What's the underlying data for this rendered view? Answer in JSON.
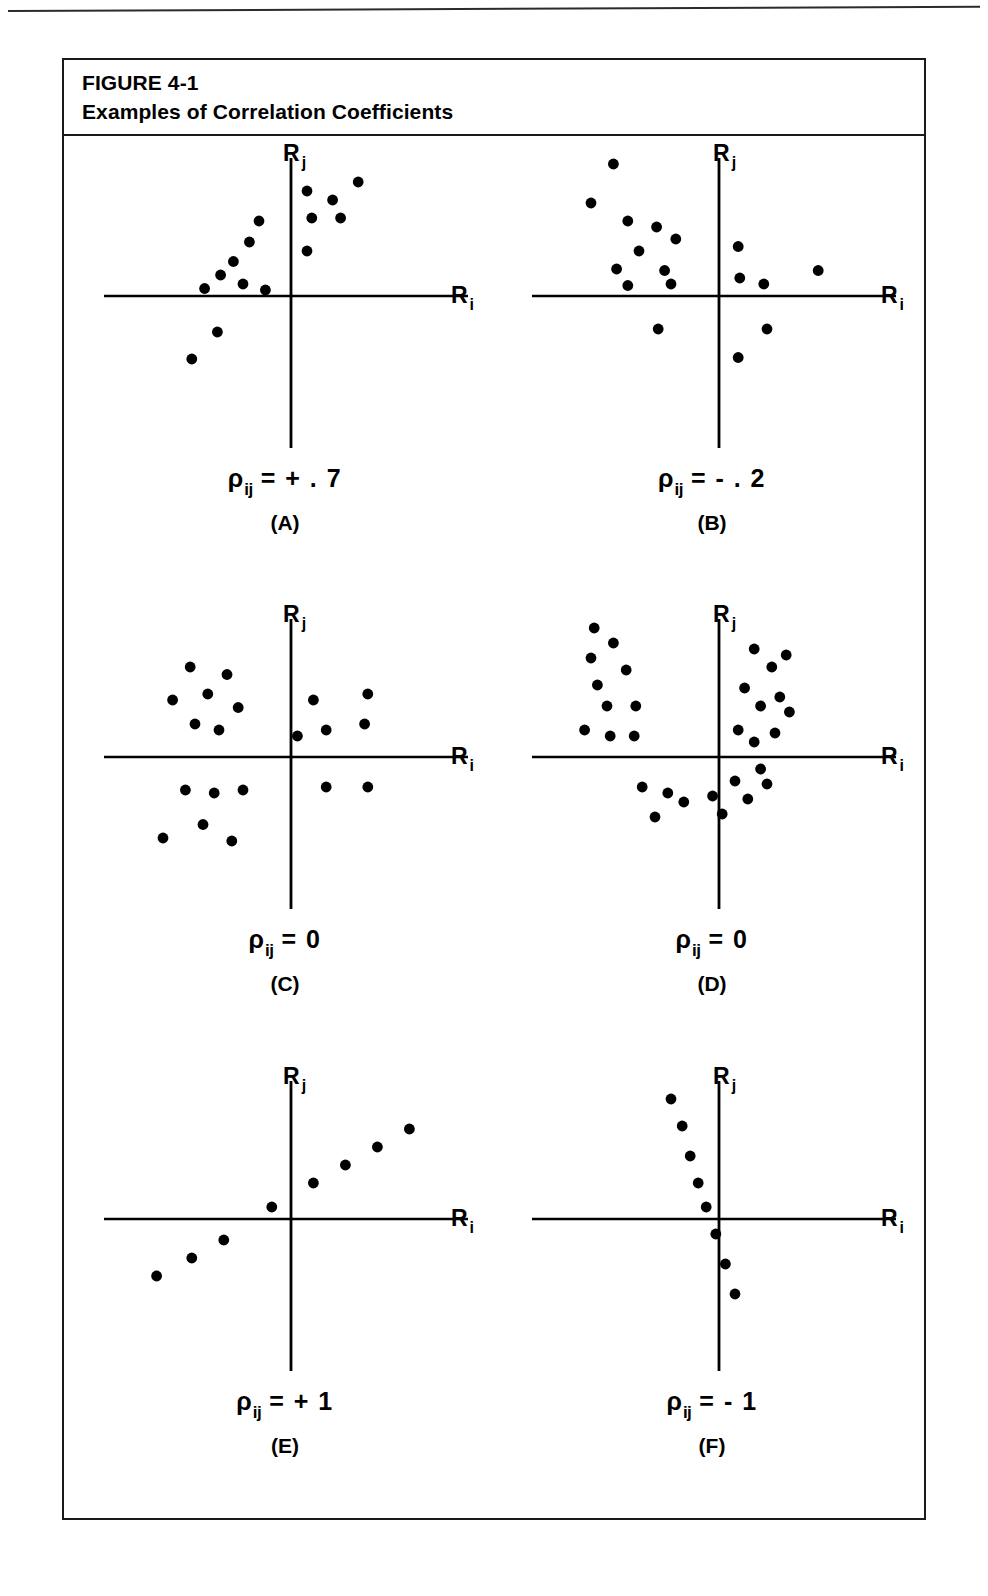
{
  "figure": {
    "number_line": "FIGURE 4-1",
    "title_line": "Examples of Correlation Coefficients"
  },
  "axis": {
    "y_base": "R",
    "y_sub": "j",
    "x_base": "R",
    "x_sub": "i"
  },
  "panels": [
    {
      "letter": "(A)",
      "rho_symbol": "ρ",
      "rho_sub": "ij",
      "rho_value": "= + . 7"
    },
    {
      "letter": "(B)",
      "rho_symbol": "ρ",
      "rho_sub": "ij",
      "rho_value": "= - . 2"
    },
    {
      "letter": "(C)",
      "rho_symbol": "ρ",
      "rho_sub": "ij",
      "rho_value": "= 0"
    },
    {
      "letter": "(D)",
      "rho_symbol": "ρ",
      "rho_sub": "ij",
      "rho_value": "= 0"
    },
    {
      "letter": "(E)",
      "rho_symbol": "ρ",
      "rho_sub": "ij",
      "rho_value": "= + 1"
    },
    {
      "letter": "(F)",
      "rho_symbol": "ρ",
      "rho_sub": "ij",
      "rho_value": "= - 1"
    }
  ],
  "colors": {
    "ink": "#000000",
    "rule": "#2b2b2b",
    "paper": "#ffffff"
  },
  "chart_data": [
    {
      "type": "scatter",
      "id": "A",
      "title": "ρij = +.7",
      "xlabel": "Ri",
      "ylabel": "Rj",
      "grid": false,
      "legend": false,
      "xlim": [
        -1,
        1
      ],
      "ylim": [
        -1,
        1
      ],
      "axes_style": "centered-cross",
      "correlation": 0.7,
      "n_points": 15,
      "points": [
        [
          -0.62,
          -0.42
        ],
        [
          -0.46,
          -0.24
        ],
        [
          -0.54,
          0.05
        ],
        [
          -0.44,
          0.14
        ],
        [
          -0.36,
          0.23
        ],
        [
          -0.3,
          0.08
        ],
        [
          -0.26,
          0.36
        ],
        [
          -0.16,
          0.04
        ],
        [
          -0.2,
          0.5
        ],
        [
          0.1,
          0.3
        ],
        [
          0.13,
          0.52
        ],
        [
          0.1,
          0.7
        ],
        [
          0.26,
          0.64
        ],
        [
          0.31,
          0.52
        ],
        [
          0.42,
          0.76
        ]
      ]
    },
    {
      "type": "scatter",
      "id": "B",
      "title": "ρij = -.2",
      "xlabel": "Ri",
      "ylabel": "Rj",
      "grid": false,
      "legend": false,
      "xlim": [
        -1,
        1
      ],
      "ylim": [
        -1,
        1
      ],
      "axes_style": "centered-cross",
      "correlation": -0.2,
      "n_points": 17,
      "points": [
        [
          -0.66,
          0.88
        ],
        [
          -0.8,
          0.62
        ],
        [
          -0.57,
          0.5
        ],
        [
          -0.39,
          0.46
        ],
        [
          -0.27,
          0.38
        ],
        [
          -0.5,
          0.3
        ],
        [
          -0.64,
          0.18
        ],
        [
          -0.34,
          0.17
        ],
        [
          -0.57,
          0.07
        ],
        [
          -0.3,
          0.08
        ],
        [
          0.12,
          0.33
        ],
        [
          0.13,
          0.12
        ],
        [
          0.28,
          0.08
        ],
        [
          0.62,
          0.17
        ],
        [
          -0.38,
          -0.22
        ],
        [
          0.3,
          -0.22
        ],
        [
          0.12,
          -0.41
        ]
      ]
    },
    {
      "type": "scatter",
      "id": "C",
      "title": "ρij = 0",
      "xlabel": "Ri",
      "ylabel": "Rj",
      "grid": false,
      "legend": false,
      "xlim": [
        -1,
        1
      ],
      "ylim": [
        -1,
        1
      ],
      "axes_style": "centered-cross",
      "correlation": 0.0,
      "n_points": 20,
      "points": [
        [
          -0.63,
          0.6
        ],
        [
          -0.4,
          0.55
        ],
        [
          -0.74,
          0.38
        ],
        [
          -0.52,
          0.42
        ],
        [
          -0.33,
          0.33
        ],
        [
          -0.6,
          0.22
        ],
        [
          -0.45,
          0.18
        ],
        [
          0.14,
          0.38
        ],
        [
          0.48,
          0.42
        ],
        [
          0.46,
          0.22
        ],
        [
          0.04,
          0.14
        ],
        [
          0.22,
          0.18
        ],
        [
          -0.66,
          -0.22
        ],
        [
          -0.48,
          -0.24
        ],
        [
          -0.3,
          -0.22
        ],
        [
          -0.55,
          -0.45
        ],
        [
          -0.8,
          -0.54
        ],
        [
          -0.37,
          -0.56
        ],
        [
          0.22,
          -0.2
        ],
        [
          0.48,
          -0.2
        ]
      ]
    },
    {
      "type": "scatter",
      "id": "D",
      "title": "ρij = 0",
      "xlabel": "Ri",
      "ylabel": "Rj",
      "grid": false,
      "legend": false,
      "xlim": [
        -1,
        1
      ],
      "ylim": [
        -1,
        1
      ],
      "axes_style": "centered-cross",
      "correlation": 0.0,
      "pattern": "u-shaped-nonlinear",
      "n_points": 30,
      "points": [
        [
          -0.78,
          0.86
        ],
        [
          -0.66,
          0.76
        ],
        [
          -0.8,
          0.66
        ],
        [
          -0.58,
          0.58
        ],
        [
          -0.76,
          0.48
        ],
        [
          -0.7,
          0.34
        ],
        [
          -0.52,
          0.34
        ],
        [
          -0.84,
          0.18
        ],
        [
          -0.68,
          0.14
        ],
        [
          -0.53,
          0.14
        ],
        [
          0.22,
          0.72
        ],
        [
          0.42,
          0.68
        ],
        [
          0.33,
          0.6
        ],
        [
          0.16,
          0.46
        ],
        [
          0.38,
          0.4
        ],
        [
          0.26,
          0.34
        ],
        [
          0.44,
          0.3
        ],
        [
          0.12,
          0.18
        ],
        [
          0.35,
          0.16
        ],
        [
          0.22,
          0.1
        ],
        [
          -0.48,
          -0.2
        ],
        [
          -0.32,
          -0.24
        ],
        [
          -0.22,
          -0.3
        ],
        [
          -0.4,
          -0.4
        ],
        [
          -0.04,
          -0.26
        ],
        [
          0.1,
          -0.16
        ],
        [
          0.3,
          -0.18
        ],
        [
          0.18,
          -0.28
        ],
        [
          0.02,
          -0.38
        ],
        [
          0.26,
          -0.08
        ]
      ]
    },
    {
      "type": "scatter",
      "id": "E",
      "title": "ρij = +1",
      "xlabel": "Ri",
      "ylabel": "Rj",
      "grid": false,
      "legend": false,
      "xlim": [
        -1,
        1
      ],
      "ylim": [
        -1,
        1
      ],
      "axes_style": "centered-cross",
      "correlation": 1.0,
      "pattern": "perfect-positive-line",
      "n_points": 8,
      "points": [
        [
          -0.84,
          -0.38
        ],
        [
          -0.62,
          -0.26
        ],
        [
          -0.42,
          -0.14
        ],
        [
          -0.12,
          0.08
        ],
        [
          0.14,
          0.24
        ],
        [
          0.34,
          0.36
        ],
        [
          0.54,
          0.48
        ],
        [
          0.74,
          0.6
        ]
      ]
    },
    {
      "type": "scatter",
      "id": "F",
      "title": "ρij = -1",
      "xlabel": "Ri",
      "ylabel": "Rj",
      "grid": false,
      "legend": false,
      "xlim": [
        -1,
        1
      ],
      "ylim": [
        -1,
        1
      ],
      "axes_style": "centered-cross",
      "correlation": -1.0,
      "pattern": "perfect-negative-line",
      "n_points": 8,
      "points": [
        [
          -0.3,
          0.8
        ],
        [
          -0.23,
          0.62
        ],
        [
          -0.18,
          0.42
        ],
        [
          -0.13,
          0.24
        ],
        [
          -0.08,
          0.08
        ],
        [
          -0.02,
          -0.1
        ],
        [
          0.04,
          -0.3
        ],
        [
          0.1,
          -0.5
        ]
      ]
    }
  ]
}
